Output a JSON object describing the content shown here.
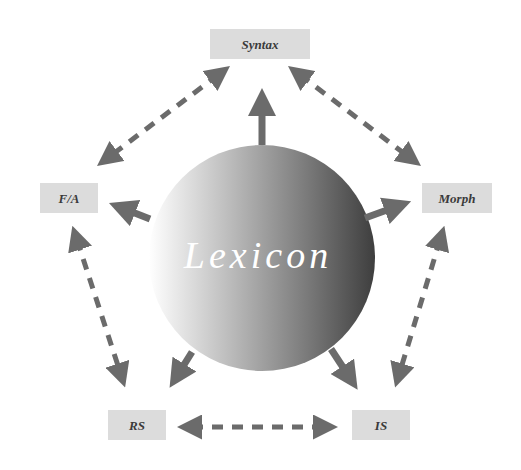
{
  "diagram": {
    "center": {
      "label": "Lexicon"
    },
    "nodes": [
      {
        "id": "syntax",
        "label": "Syntax"
      },
      {
        "id": "morph",
        "label": "Morph"
      },
      {
        "id": "is",
        "label": "IS"
      },
      {
        "id": "rs",
        "label": "RS"
      },
      {
        "id": "fa",
        "label": "F/A"
      }
    ],
    "radial_arrows": [
      {
        "from": "lexicon",
        "to": "syntax",
        "style": "solid"
      },
      {
        "from": "lexicon",
        "to": "morph",
        "style": "solid"
      },
      {
        "from": "lexicon",
        "to": "is",
        "style": "solid"
      },
      {
        "from": "lexicon",
        "to": "rs",
        "style": "solid"
      },
      {
        "from": "lexicon",
        "to": "fa",
        "style": "solid"
      }
    ],
    "peripheral_links": [
      {
        "a": "syntax",
        "b": "morph",
        "style": "dashed",
        "bidirectional": true
      },
      {
        "a": "morph",
        "b": "is",
        "style": "dashed",
        "bidirectional": true
      },
      {
        "a": "is",
        "b": "rs",
        "style": "dashed",
        "bidirectional": true
      },
      {
        "a": "rs",
        "b": "fa",
        "style": "dashed",
        "bidirectional": true
      },
      {
        "a": "fa",
        "b": "syntax",
        "style": "dashed",
        "bidirectional": true
      }
    ],
    "colors": {
      "arrow": "#6b6b6b",
      "box_fill": "#dcdcdc",
      "sphere_light": "#ffffff",
      "sphere_dark": "#3e3e3e"
    }
  }
}
